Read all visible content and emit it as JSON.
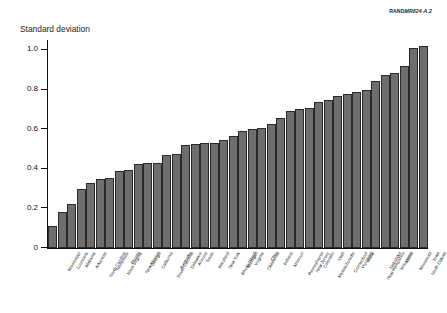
{
  "source_id": {
    "bold": "RAND",
    "italic": "MR824-A.2"
  },
  "chart_data": {
    "type": "bar",
    "title": "",
    "subtitle": "",
    "ylabel": "Standard deviation",
    "xlabel": "",
    "ylim": [
      0,
      1.05
    ],
    "yticks": [
      0,
      0.2,
      0.4,
      0.6,
      0.8,
      1.0
    ],
    "ytick_labels": [
      "0",
      "0.2",
      "0.4",
      "0.6",
      "0.8",
      "1.0"
    ],
    "grid": false,
    "legend": "none",
    "bar_color": "#6e6e6e",
    "bar_edge_color": "#2a2a2a",
    "sorted": "ascending",
    "categories": [
      "Mississippi",
      "Louisiana",
      "Alabama",
      "Arkansas",
      "North Carolina",
      "Tennessee",
      "West Virginia",
      "Florida",
      "New Mexico",
      "Georgia",
      "California",
      "South Carolina",
      "Kentucky",
      "Delaware",
      "Arizona",
      "Texas",
      "Maryland",
      "New York",
      "Rhode Island",
      "Michigan",
      "Virginia",
      "Oklahoma",
      "Ohio",
      "Indiana",
      "Missouri",
      "Pennsylvania",
      "New Jersey",
      "Colorado",
      "Massachusetts",
      "Utah",
      "Connecticut",
      "Wyoming",
      "Idaho",
      "New Hampshire",
      "Nebraska",
      "Wisconsin",
      "Maine",
      "Minnesota",
      "North Dakota",
      "Iowa"
    ],
    "values": [
      0.11,
      0.18,
      0.22,
      0.3,
      0.33,
      0.35,
      0.355,
      0.39,
      0.395,
      0.425,
      0.43,
      0.43,
      0.47,
      0.475,
      0.52,
      0.525,
      0.53,
      0.53,
      0.545,
      0.565,
      0.59,
      0.6,
      0.605,
      0.625,
      0.655,
      0.69,
      0.7,
      0.705,
      0.735,
      0.745,
      0.765,
      0.78,
      0.79,
      0.8,
      0.845,
      0.875,
      0.885,
      0.92,
      1.01,
      1.02
    ]
  }
}
